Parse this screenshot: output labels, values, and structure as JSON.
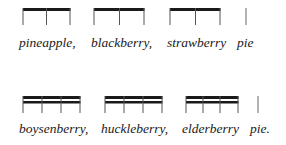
{
  "colors": {
    "ink": "#1a1a1a",
    "stem": "#555555",
    "background": "#ffffff"
  },
  "rows": [
    {
      "name": "row-1",
      "beams": 1,
      "text_top": 36,
      "beam_top": 8,
      "stem_bottom": 25,
      "groups": [
        {
          "word": "pineapple,",
          "word_x": 19,
          "x_start": 23,
          "x_end": 70,
          "stems": [
            23,
            46,
            70
          ]
        },
        {
          "word": "blackberry,",
          "word_x": 91,
          "x_start": 94,
          "x_end": 144,
          "stems": [
            94,
            119,
            144
          ]
        },
        {
          "word": "strawberry",
          "word_x": 167,
          "x_start": 170,
          "x_end": 220,
          "stems": [
            170,
            195,
            220
          ]
        },
        {
          "word": "pie",
          "word_x": 237,
          "x_start": 246,
          "x_end": 246,
          "stems": [
            246
          ]
        }
      ]
    },
    {
      "name": "row-2",
      "beams": 2,
      "text_top": 122,
      "beam_top": 96,
      "stem_bottom": 113,
      "groups": [
        {
          "word": "boysenberry,",
          "word_x": 19,
          "x_start": 23,
          "x_end": 80,
          "stems": [
            23,
            42,
            61,
            80
          ]
        },
        {
          "word": "huckleberry,",
          "word_x": 101,
          "x_start": 105,
          "x_end": 162,
          "stems": [
            105,
            124,
            143,
            162
          ]
        },
        {
          "word": "elderberry",
          "word_x": 182,
          "x_start": 186,
          "x_end": 238,
          "stems": [
            186,
            203,
            220,
            238
          ]
        },
        {
          "word": "pie.",
          "word_x": 250,
          "x_start": 258,
          "x_end": 258,
          "stems": [
            258
          ]
        }
      ]
    }
  ]
}
